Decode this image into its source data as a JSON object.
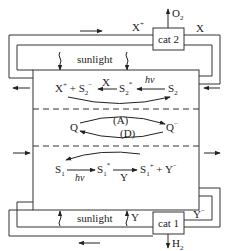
{
  "diagram": {
    "type": "photochemical water-splitting cycle",
    "top_loop": {
      "catalyst_label": "cat 2",
      "product": "O",
      "product_sub": "2",
      "left_species": "X",
      "left_species_sup": "+",
      "right_species": "X",
      "sunlight_label": "sunlight"
    },
    "bottom_loop": {
      "catalyst_label": "cat 1",
      "product": "H",
      "product_sub": "2",
      "left_species": "Y",
      "right_species": "Y",
      "right_species_sup": "−",
      "sunlight_label": "sunlight"
    },
    "upper_compartment": {
      "left_species": "X",
      "left_species_sup": "+",
      "plus": "+",
      "reduced_sens": "S",
      "reduced_sens_sub": "2",
      "reduced_sens_sup": "−",
      "arrow_label": "X",
      "excited_sens": "S",
      "excited_sens_sub": "2",
      "excited_sens_sup": "*",
      "light_label": "hν",
      "ground_sens": "S",
      "ground_sens_sub": "2"
    },
    "middle_compartment": {
      "left_species": "Q",
      "right_species": "Q",
      "right_species_sup": "−",
      "forward_label": "(A)",
      "back_label": "(D)"
    },
    "lower_compartment": {
      "ground_sens": "S",
      "ground_sens_sub": "1",
      "light_label": "hν",
      "excited_sens": "S",
      "excited_sens_sub": "1",
      "excited_sens_sup": "*",
      "arrow_label": "Y",
      "oxidized_sens": "S",
      "oxidized_sens_sub": "1",
      "oxidized_sens_sup": "+",
      "plus": "+",
      "right_species": "Y",
      "right_species_sup": "−"
    }
  }
}
